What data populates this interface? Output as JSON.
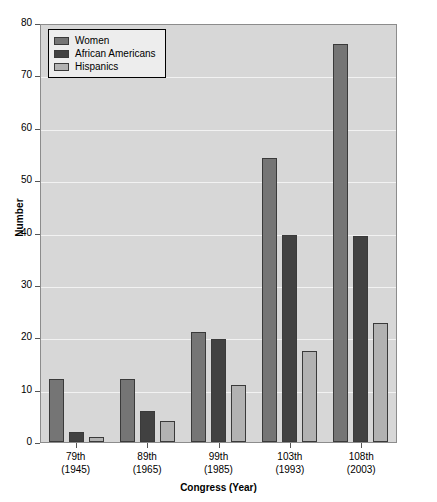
{
  "chart_data": {
    "type": "bar",
    "title": "",
    "xlabel": "Congress (Year)",
    "ylabel": "Number",
    "ylim": [
      0,
      80
    ],
    "yticks": [
      0,
      10,
      20,
      30,
      40,
      50,
      60,
      70,
      80
    ],
    "grid": true,
    "legend_position": "top-left",
    "categories": [
      "79th\n(1945)",
      "89th\n(1965)",
      "99th\n(1985)",
      "103th\n(1993)",
      "108th\n(2003)"
    ],
    "category_lines": [
      [
        "79th",
        "(1945)"
      ],
      [
        "89th",
        "(1965)"
      ],
      [
        "99th",
        "(1985)"
      ],
      [
        "103th",
        "(1993)"
      ],
      [
        "108th",
        "(2003)"
      ]
    ],
    "series": [
      {
        "name": "Women",
        "color": "#757575",
        "values": [
          12,
          12,
          21,
          54.3,
          76
        ]
      },
      {
        "name": "African Americans",
        "color": "#414141",
        "values": [
          2,
          6,
          19.7,
          39.6,
          39.3
        ]
      },
      {
        "name": "Hispanics",
        "color": "#b2b2b2",
        "values": [
          1,
          4,
          10.8,
          17.3,
          22.8
        ]
      }
    ]
  },
  "colors": {
    "plot_background": "#d7d7d7",
    "gridline": "#f2f2f2",
    "axis": "#8c8c8c",
    "legend_background": "#ededed",
    "bar_outline": "#3a3a3a",
    "text": "#000000"
  }
}
